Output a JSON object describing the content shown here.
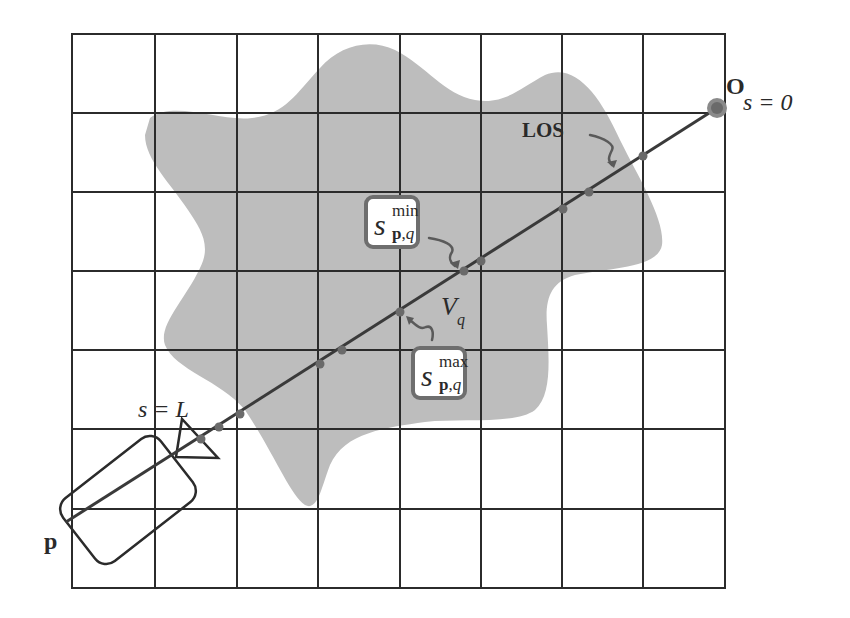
{
  "diagram": {
    "colors": {
      "grid_line": "#2b2b2b",
      "volume_fill": "#bdbdbd",
      "los_line": "#3a3a3a",
      "intersection_dot": "#666666",
      "callout_border": "#6e6e6e",
      "text": "#2a2a2a"
    },
    "grid": {
      "columns": 8,
      "rows": 7
    },
    "labels": {
      "origin": "O",
      "origin_param": "s = 0",
      "los": "LOS",
      "end_param": "s = L",
      "pixel": "p",
      "voxel": "V",
      "voxel_sub": "q"
    },
    "callouts": {
      "s_min": {
        "base": "s",
        "sup": "min",
        "sub_bold": "p",
        "sub_sep": ",",
        "sub_ital": "q"
      },
      "s_max": {
        "base": "s",
        "sup": "max",
        "sub_bold": "p",
        "sub_sep": ",",
        "sub_ital": "q"
      }
    },
    "icons": {
      "camera": "camera-icon",
      "lens": "lens-triangle-icon",
      "origin_point": "origin-point-icon"
    }
  }
}
